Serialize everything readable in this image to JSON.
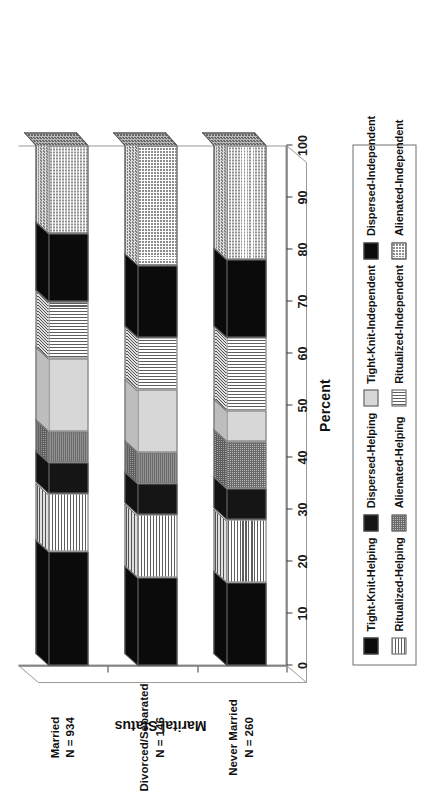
{
  "chart_data": {
    "type": "bar",
    "subtype": "stacked-bar-3d-horizontal",
    "title": "",
    "xlabel": "Percent",
    "ylabel": "Marital Status",
    "xlim": [
      0,
      100
    ],
    "grid": false,
    "legend_position": "bottom",
    "orientation": "horizontal",
    "rotation_note": "entire figure rendered rotated 90 degrees counter-clockwise",
    "xticks": [
      "0",
      "10",
      "20",
      "30",
      "40",
      "50",
      "60",
      "70",
      "80",
      "90",
      "100"
    ],
    "xtick_values": [
      0,
      10,
      20,
      30,
      40,
      50,
      60,
      70,
      80,
      90,
      100
    ],
    "categories": [
      {
        "name": "Married",
        "n_label": "N = 934",
        "n": 934
      },
      {
        "name": "Divorced/Separated",
        "n_label": "N = 146",
        "n": 146
      },
      {
        "name": "Never Married",
        "n_label": "N = 260",
        "n": 260
      }
    ],
    "series": [
      {
        "name": "Tight-Knit-Helping",
        "pattern": "solid-black",
        "values": [
          22,
          17,
          16
        ]
      },
      {
        "name": "Ritualized-Helping",
        "pattern": "horizontal-hatch",
        "values": [
          11,
          12,
          12
        ]
      },
      {
        "name": "Dispersed-Helping",
        "pattern": "solid-dark",
        "values": [
          6,
          6,
          6
        ]
      },
      {
        "name": "Alienated-Helping",
        "pattern": "checker-gray",
        "values": [
          6,
          6,
          9
        ]
      },
      {
        "name": "Tight-Knit-Independent",
        "pattern": "light-gray",
        "values": [
          14,
          12,
          6
        ]
      },
      {
        "name": "Ritualized-Independent",
        "pattern": "vertical-hatch",
        "values": [
          11,
          10,
          14
        ]
      },
      {
        "name": "Dispersed-Independent",
        "pattern": "solid-black",
        "values": [
          13,
          14,
          15
        ]
      },
      {
        "name": "Alienated-Independent",
        "pattern": "dense-grid",
        "values": [
          17,
          23,
          22
        ]
      }
    ]
  },
  "axis": {
    "x_title": "Percent",
    "y_title": "Marital Status"
  },
  "legend": {
    "items": [
      {
        "label": "Tight-Knit-Helping",
        "pattern": "solid-black"
      },
      {
        "label": "Ritualized-Helping",
        "pattern": "horizontal-hatch"
      },
      {
        "label": "Dispersed-Helping",
        "pattern": "solid-dark"
      },
      {
        "label": "Alienated-Helping",
        "pattern": "checker-gray"
      },
      {
        "label": "Tight-Knit-Independent",
        "pattern": "light-gray"
      },
      {
        "label": "Ritualized-Independent",
        "pattern": "vertical-hatch"
      },
      {
        "label": "Dispersed-Independent",
        "pattern": "solid-black"
      },
      {
        "label": "Alienated-Independent",
        "pattern": "dense-grid"
      }
    ]
  },
  "colors": {
    "solid_black": "#0b0b0b",
    "solid_dark": "#151515",
    "light_gray": "#d7d7d7",
    "mid_gray": "#a8a8a8",
    "frame": "#9a9a9a",
    "text": "#111111",
    "background": "#ffffff"
  }
}
